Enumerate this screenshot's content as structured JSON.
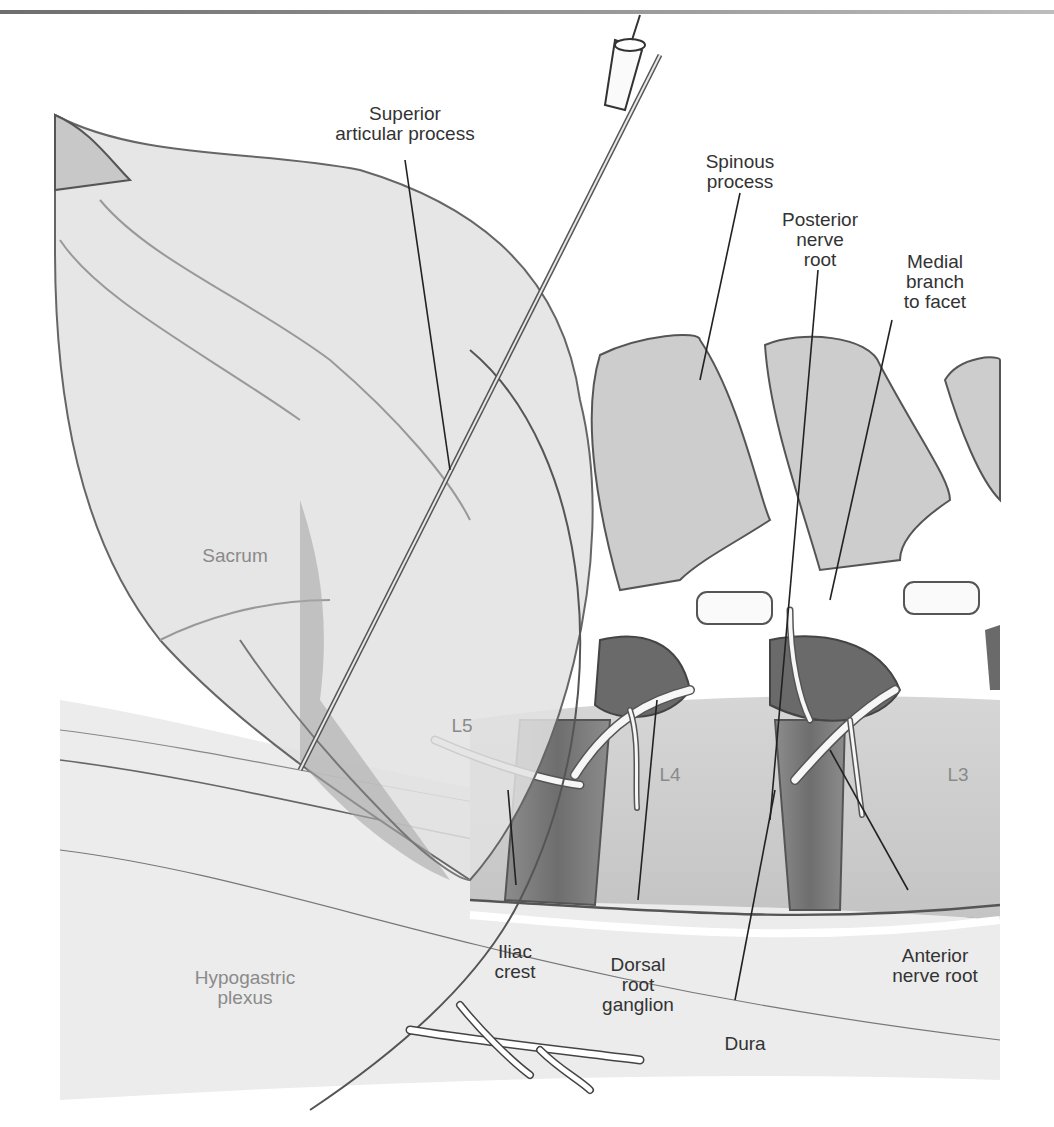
{
  "figure": {
    "colors": {
      "background": "#ffffff",
      "bone_light": "#e4e4e4",
      "bone_mid": "#cfcfcf",
      "bone_dark": "#9a9a9a",
      "disc_dark": "#7d7d7d",
      "outline": "#555555",
      "nerve": "#f6f6f6",
      "label_dark": "#333333",
      "label_light": "#8a8a8a",
      "top_rule": "#7a7a7a"
    },
    "labels": {
      "superior_articular_process": "Superior\narticular process",
      "spinous_process": "Spinous\nprocess",
      "posterior_nerve_root": "Posterior\nnerve\nroot",
      "medial_branch": "Medial\nbranch\nto facet",
      "sacrum": "Sacrum",
      "l5": "L5",
      "l4": "L4",
      "l3": "L3",
      "iliac_crest": "Iliac\ncrest",
      "dorsal_root_ganglion": "Dorsal\nroot\nganglion",
      "dura": "Dura",
      "anterior_nerve_root": "Anterior\nnerve root",
      "hypogastric_plexus": "Hypogastric\nplexus"
    }
  }
}
